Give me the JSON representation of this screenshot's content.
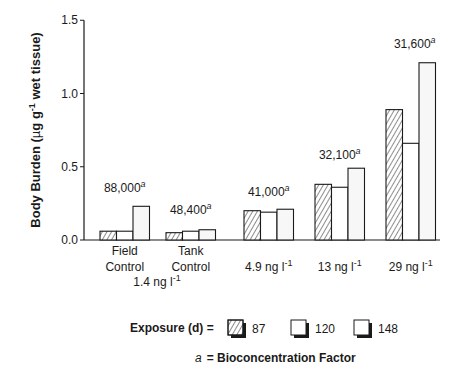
{
  "chart_data": {
    "type": "bar",
    "title": "",
    "xlabel": "",
    "ylabel": "Body Burden (µg g-1 wet tissue)",
    "ylabel_parts": {
      "pre": "Body Burden (",
      "mu": "µ",
      "g": "g g",
      "sup": "-1",
      "post": " wet tissue)"
    },
    "ylim": [
      0,
      1.5
    ],
    "yticks": [
      "0.0",
      "0.5",
      "1.0",
      "1.5"
    ],
    "categories": [
      "Field Control",
      "Tank Control",
      "4.9 ng l-1",
      "13 ng l-1",
      "29 ng l-1"
    ],
    "category_labels": [
      {
        "line1": "Field",
        "line2": "Control"
      },
      {
        "line1": "Tank",
        "line2": "Control"
      },
      {
        "line1": "4.9 ng l",
        "sup": "-1"
      },
      {
        "line1": "13 ng l",
        "sup": "-1"
      },
      {
        "line1": "29 ng l",
        "sup": "-1"
      }
    ],
    "shared_label": {
      "text": "1.4 ng l",
      "sup": "-1"
    },
    "series": [
      {
        "name": "87",
        "pattern": "hatched",
        "values": [
          0.06,
          0.05,
          0.2,
          0.38,
          0.89
        ]
      },
      {
        "name": "120",
        "pattern": "open",
        "values": [
          0.06,
          0.06,
          0.19,
          0.36,
          0.66
        ]
      },
      {
        "name": "148",
        "pattern": "open-shaded",
        "values": [
          0.23,
          0.07,
          0.21,
          0.49,
          1.21
        ]
      }
    ],
    "annotations": [
      {
        "category": "Field Control",
        "text": "88,000",
        "sup": "a"
      },
      {
        "category": "Tank Control",
        "text": "48,400",
        "sup": "a"
      },
      {
        "category": "4.9 ng l-1",
        "text": "41,000",
        "sup": "a"
      },
      {
        "category": "13 ng l-1",
        "text": "32,100",
        "sup": "a"
      },
      {
        "category": "29 ng l-1",
        "text": "31,600",
        "sup": "a"
      }
    ],
    "legend": {
      "title": "Exposure (d) =",
      "entries": [
        "87",
        "120",
        "148"
      ],
      "position": "bottom"
    },
    "footnote": {
      "symbol": "a",
      "text": "= Bioconcentration Factor"
    },
    "grid": false
  }
}
